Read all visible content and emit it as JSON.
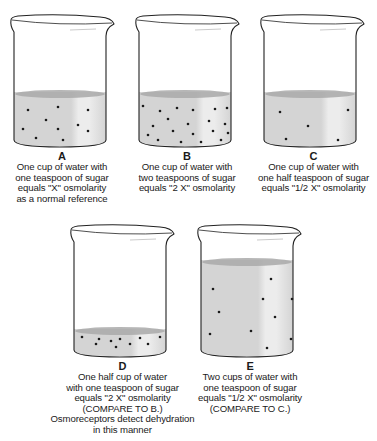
{
  "figure": {
    "colors": {
      "liquid": "#d4d4d4",
      "liquid_surface": "#a9a9a9",
      "liquid_highlight": "#ececec",
      "glass_outline": "#222222",
      "particle": "#1a1a1a"
    },
    "beakers": [
      {
        "id": "A",
        "letter": "A",
        "water_cups": 1,
        "sugar_teaspoons": 1,
        "osmolarity": "X",
        "particle_count": 10,
        "caption": [
          "One cup of water with",
          "one teaspoon of sugar",
          "equals \"X\" osmolarity",
          "as a normal reference"
        ]
      },
      {
        "id": "B",
        "letter": "B",
        "water_cups": 1,
        "sugar_teaspoons": 2,
        "osmolarity": "2 X",
        "particle_count": 20,
        "caption": [
          "One cup of water with",
          "two teaspoons of sugar",
          "equals \"2 X\" osmolarity"
        ]
      },
      {
        "id": "C",
        "letter": "C",
        "water_cups": 1,
        "sugar_teaspoons": 0.5,
        "osmolarity": "1/2 X",
        "particle_count": 5,
        "caption": [
          "One cup of water with",
          "one half teaspoon of sugar",
          "equals \"1/2 X\" osmolarity"
        ]
      },
      {
        "id": "D",
        "letter": "D",
        "water_cups": 0.5,
        "sugar_teaspoons": 1,
        "osmolarity": "2 X",
        "particle_count": 10,
        "caption": [
          "One half cup of water",
          "with one teaspoon of sugar",
          "equals \"2 X\" osmolarity",
          "(COMPARE TO B.)",
          "Osmoreceptors detect dehydration",
          "in this manner"
        ]
      },
      {
        "id": "E",
        "letter": "E",
        "water_cups": 2,
        "sugar_teaspoons": 1,
        "osmolarity": "1/2 X",
        "particle_count": 10,
        "caption": [
          "Two cups of water with",
          "one teaspoon of sugar",
          "equals \"1/2 X\" osmolarity",
          "(COMPARE TO C.)"
        ]
      }
    ]
  }
}
